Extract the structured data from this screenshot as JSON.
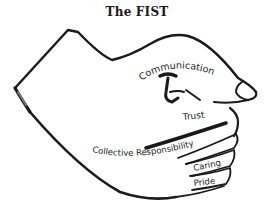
{
  "title": "The FIST",
  "labels": {
    "index_finger": "Communication",
    "thumb": "Trust",
    "middle_finger": "Collective Responsibility",
    "ring_finger": "Caring",
    "little_finger": "Pride"
  },
  "colors": {
    "stroke": "#1a1a1a",
    "background": "#ffffff"
  }
}
